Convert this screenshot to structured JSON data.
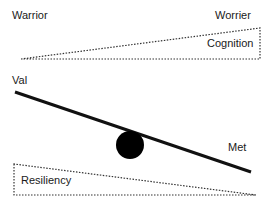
{
  "labels": {
    "warrior": "Warrior",
    "worrier": "Worrier",
    "cognition": "Cognition",
    "val": "Val",
    "met": "Met",
    "resiliency": "Resiliency"
  },
  "colors": {
    "stroke": "#111111",
    "dotted": "#333333",
    "text": "#1a1a1a",
    "ball": "#000000",
    "background": "#ffffff"
  }
}
